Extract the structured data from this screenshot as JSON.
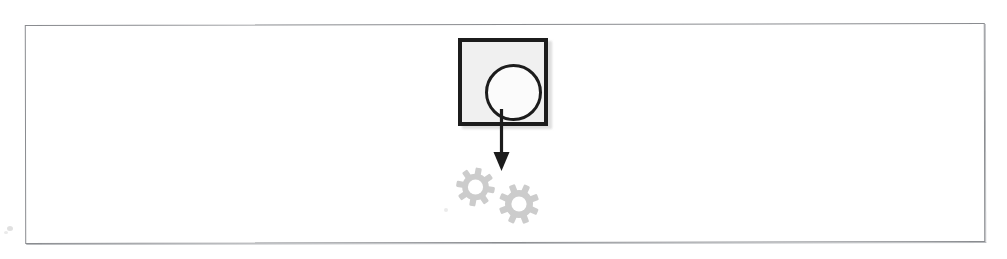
{
  "canvas": {
    "width": 1007,
    "height": 259,
    "background_color": "#ffffff"
  },
  "frame": {
    "name": "figure-border",
    "border_color": "#8a8c90",
    "fill_color": "#ffffff"
  },
  "diagram": {
    "type": "flow-diagram",
    "title": "",
    "nodes": [
      {
        "id": "source-node",
        "shape": "square-with-circle",
        "icon": "circle-in-square-icon",
        "label": "",
        "fill_color": "#f0f0f0",
        "stroke_color": "#1c1c1c",
        "inner_shape": "circle",
        "inner_fill_color": "#fbfbfb"
      },
      {
        "id": "target-node",
        "shape": "gear-pair",
        "icon": "gears-icon",
        "label": "",
        "fill_color": "#cccccc",
        "gear_count": 2,
        "teeth_per_gear": 8
      }
    ],
    "connector": {
      "id": "flow-connector",
      "type": "arrow",
      "direction": "down",
      "label": "",
      "color": "#1c1c1c",
      "arrowhead": "solid-triangle"
    }
  },
  "artifacts": {
    "speckles": 3
  }
}
